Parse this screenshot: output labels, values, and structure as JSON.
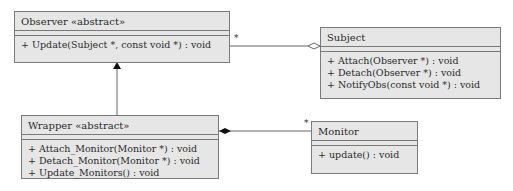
{
  "classes": {
    "observer": {
      "name": "Observer «abstract»",
      "operations": [
        "+ Update(Subject *, const void *) : void"
      ]
    },
    "subject": {
      "name": "Subject",
      "operations": [
        "+ Attach(Observer *) : void",
        "+ Detach(Observer *) : void",
        "+ NotifyObs(const void *) : void"
      ]
    },
    "wrapper": {
      "name": "Wrapper «abstract»",
      "operations": [
        "+ Attach_Monitor(Monitor *) : void",
        "+ Detach_Monitor(Monitor *) : void",
        "+ Update_Monitors() : void"
      ]
    },
    "monitor": {
      "name": "Monitor",
      "operations": [
        "+ update() : void"
      ]
    }
  },
  "relations": {
    "observer_subject": {
      "type": "aggregation",
      "multiplicity": "*"
    },
    "wrapper_observer": {
      "type": "generalization"
    },
    "wrapper_monitor": {
      "type": "composition",
      "multiplicity": "*"
    }
  }
}
